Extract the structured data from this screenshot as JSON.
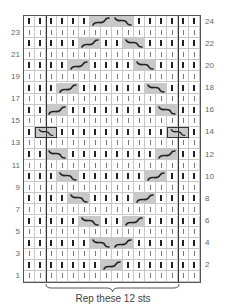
{
  "chart": {
    "cols": 16,
    "rows": 24,
    "repeat_start_col": 3,
    "repeat_end_col": 14,
    "repeat_label": "Rep these 12 sts",
    "left_row_numbers": [
      23,
      21,
      19,
      17,
      15,
      13,
      11,
      9,
      7,
      5,
      3,
      1
    ],
    "right_row_numbers": [
      24,
      22,
      20,
      18,
      16,
      14,
      12,
      10,
      8,
      6,
      4,
      2
    ],
    "symbols": {
      "knit_ws": "bold vertical bar (even rows)",
      "knit_rs": "thin vertical bar (odd rows)",
      "cable_right": "2-st cross rising left-to-right (/)",
      "cable_left": "2-st cross falling left-to-right (\\)"
    },
    "cables": [
      {
        "row": 24,
        "col": 7,
        "dir": "right"
      },
      {
        "row": 24,
        "col": 9,
        "dir": "left"
      },
      {
        "row": 22,
        "col": 6,
        "dir": "right"
      },
      {
        "row": 22,
        "col": 10,
        "dir": "left"
      },
      {
        "row": 20,
        "col": 5,
        "dir": "right"
      },
      {
        "row": 20,
        "col": 11,
        "dir": "left"
      },
      {
        "row": 18,
        "col": 4,
        "dir": "right"
      },
      {
        "row": 18,
        "col": 12,
        "dir": "left"
      },
      {
        "row": 16,
        "col": 3,
        "dir": "right"
      },
      {
        "row": 16,
        "col": 13,
        "dir": "left"
      },
      {
        "row": 14,
        "col": 2,
        "dir": "left",
        "outlined": true
      },
      {
        "row": 14,
        "col": 14,
        "dir": "left",
        "outlined": true
      },
      {
        "row": 12,
        "col": 3,
        "dir": "left"
      },
      {
        "row": 12,
        "col": 13,
        "dir": "right"
      },
      {
        "row": 10,
        "col": 4,
        "dir": "left"
      },
      {
        "row": 10,
        "col": 12,
        "dir": "right"
      },
      {
        "row": 8,
        "col": 5,
        "dir": "left"
      },
      {
        "row": 8,
        "col": 11,
        "dir": "right"
      },
      {
        "row": 6,
        "col": 6,
        "dir": "left"
      },
      {
        "row": 6,
        "col": 10,
        "dir": "right"
      },
      {
        "row": 4,
        "col": 7,
        "dir": "left"
      },
      {
        "row": 4,
        "col": 9,
        "dir": "right"
      },
      {
        "row": 2,
        "col": 8,
        "dir": "right"
      }
    ],
    "colors": {
      "cable_fill": "#c9c9c9",
      "grid_line": "#c8c8c8",
      "border": "#555555",
      "repeat_line": "#333333"
    }
  }
}
